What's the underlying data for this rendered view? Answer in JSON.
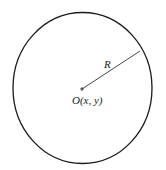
{
  "diagram": {
    "type": "circle",
    "center_label": "O(x, y)",
    "radius_label": "R",
    "colors": {
      "stroke": "#1a1a1a",
      "radius_line": "#333333",
      "background": "#ffffff"
    }
  }
}
